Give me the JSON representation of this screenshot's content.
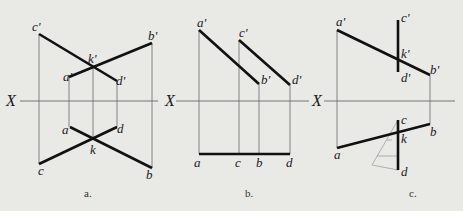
{
  "figure": {
    "background": "#e9e9e6",
    "line_color": "#111111",
    "panels": [
      {
        "id": "a",
        "caption": "a.",
        "axis_label": "X",
        "points": {
          "c'": [
            39,
            34
          ],
          "b'": [
            152,
            43
          ],
          "k'": [
            93,
            67
          ],
          "a'": [
            69,
            77
          ],
          "d'": [
            117,
            81
          ],
          "a": [
            70,
            127
          ],
          "d": [
            117,
            127
          ],
          "k": [
            93,
            140
          ],
          "c": [
            39,
            164
          ],
          "b": [
            152,
            168
          ]
        },
        "labels": [
          "c'",
          "b'",
          "k'",
          "a'",
          "d'",
          "a",
          "d",
          "k",
          "c",
          "b"
        ]
      },
      {
        "id": "b",
        "caption": "b.",
        "axis_label": "X",
        "points": {
          "a'": [
            199,
            30
          ],
          "c'": [
            239,
            40
          ],
          "b'": [
            259,
            84
          ],
          "d'": [
            290,
            85
          ],
          "a": [
            199,
            154
          ],
          "c": [
            239,
            154
          ],
          "b": [
            259,
            154
          ],
          "d": [
            290,
            154
          ]
        },
        "labels": [
          "a'",
          "c'",
          "b'",
          "d'",
          "a",
          "c",
          "b",
          "d"
        ]
      },
      {
        "id": "c",
        "caption": "c.",
        "axis_label": "X",
        "points": {
          "a'": [
            337,
            30
          ],
          "c'": [
            398,
            20
          ],
          "k'": [
            398,
            60
          ],
          "d'": [
            398,
            72
          ],
          "b'": [
            430,
            75
          ],
          "c": [
            398,
            120
          ],
          "b": [
            430,
            124
          ],
          "k": [
            398,
            133
          ],
          "a": [
            337,
            148
          ],
          "d": [
            398,
            170
          ]
        },
        "labels": [
          "a'",
          "c'",
          "k'",
          "d'",
          "b'",
          "c",
          "b",
          "k",
          "a",
          "d"
        ]
      }
    ]
  }
}
